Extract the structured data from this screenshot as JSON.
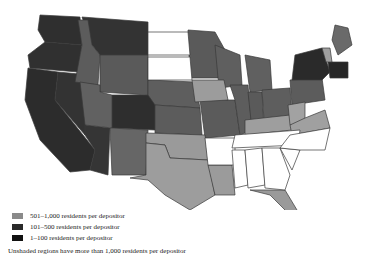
{
  "map": {
    "type": "choropleth",
    "region": "Contiguous United States",
    "shades": {
      "cat_1_100": "#2f2f2f",
      "cat_101_500": "#5a5a5a",
      "cat_501_1000": "#9a9a9a",
      "unshaded": "#ffffff"
    }
  },
  "legend": {
    "items": [
      {
        "label": "501–1,000 residents per depositor",
        "color": "#8a8a8a"
      },
      {
        "label": "101–500 residents per depositor",
        "color": "#2a2a2a"
      },
      {
        "label": "1–100 residents per depositor",
        "color": "#111111"
      }
    ],
    "note": "Unshaded regions have more than 1,000 residents per depositor"
  }
}
